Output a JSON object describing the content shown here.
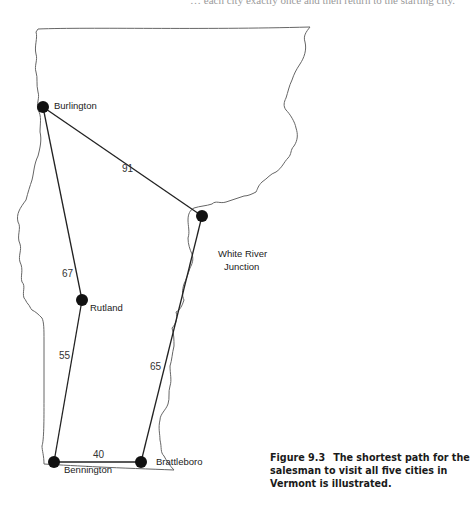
{
  "header_fragment": "… each city exactly once and then return to the starting city.",
  "map": {
    "state": "Vermont",
    "cities": [
      {
        "id": "burlington",
        "name": "Burlington"
      },
      {
        "id": "white-river-junction",
        "name": "White River Junction",
        "lines": [
          "White River",
          "Junction"
        ]
      },
      {
        "id": "rutland",
        "name": "Rutland"
      },
      {
        "id": "bennington",
        "name": "Bennington"
      },
      {
        "id": "brattleboro",
        "name": "Brattleboro"
      }
    ],
    "route": [
      {
        "from": "burlington",
        "to": "white-river-junction",
        "distance": "91"
      },
      {
        "from": "white-river-junction",
        "to": "brattleboro",
        "distance": "65"
      },
      {
        "from": "brattleboro",
        "to": "bennington",
        "distance": "40"
      },
      {
        "from": "bennington",
        "to": "rutland",
        "distance": "55"
      },
      {
        "from": "rutland",
        "to": "burlington",
        "distance": "67"
      }
    ],
    "colors": {
      "node": "#111111",
      "edge": "#222222",
      "border": "#555555"
    }
  },
  "caption": {
    "figure_number": "Figure 9.3",
    "text": "The shortest path for the salesman to visit all five cities in Vermont is illustrated."
  }
}
